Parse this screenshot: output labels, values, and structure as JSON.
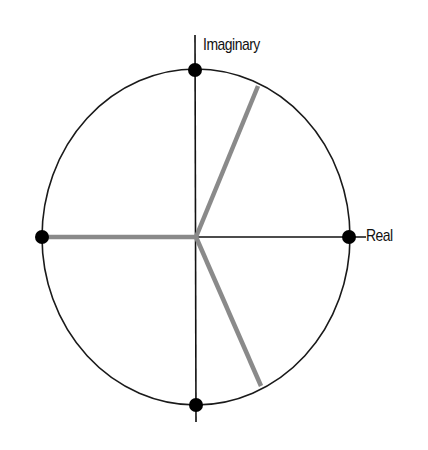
{
  "diagram": {
    "title": "",
    "axes": {
      "real_label": "Real",
      "imaginary_label": "Imaginary"
    },
    "circle": {
      "cx": 196,
      "cy": 237,
      "rx": 154,
      "ry": 168,
      "stroke": "#1a1a1a"
    },
    "points": [
      {
        "name": "top",
        "x": 195,
        "y": 70
      },
      {
        "name": "right",
        "x": 349,
        "y": 237
      },
      {
        "name": "bottom",
        "x": 196,
        "y": 405
      },
      {
        "name": "left",
        "x": 42,
        "y": 237
      }
    ],
    "spokes": [
      {
        "name": "left",
        "x2": 44,
        "y2": 237
      },
      {
        "name": "upper-right",
        "x2": 258,
        "y2": 86
      },
      {
        "name": "lower-right",
        "x2": 261,
        "y2": 386
      }
    ],
    "spoke_color": "#8a8a8a",
    "axis_color": "#111111"
  }
}
